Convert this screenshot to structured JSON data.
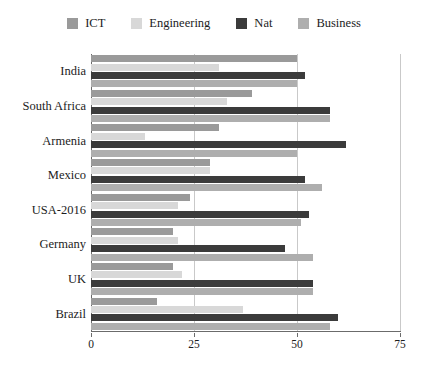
{
  "chart_data": {
    "type": "bar",
    "orientation": "horizontal",
    "title": "",
    "xlabel": "",
    "ylabel": "",
    "xlim": [
      0,
      75
    ],
    "xticks": [
      0,
      25,
      50,
      75
    ],
    "grid": true,
    "legend_position": "top",
    "categories": [
      "India",
      "South Africa",
      "Armenia",
      "Mexico",
      "USA-2016",
      "Germany",
      "UK",
      "Brazil"
    ],
    "series": [
      {
        "name": "ICT",
        "color": "#9a9a9a",
        "values": [
          50,
          39,
          31,
          29,
          24,
          20,
          20,
          16
        ]
      },
      {
        "name": "Engineering",
        "color": "#d8d8d8",
        "values": [
          31,
          33,
          13,
          29,
          21,
          21,
          22,
          37
        ]
      },
      {
        "name": "Nat",
        "color": "#3b3b3b",
        "values": [
          52,
          58,
          62,
          52,
          53,
          47,
          54,
          60
        ]
      },
      {
        "name": "Business",
        "color": "#aeaeae",
        "values": [
          50,
          58,
          50,
          56,
          51,
          54,
          54,
          58
        ]
      }
    ]
  },
  "legend": {
    "items": [
      {
        "label": "ICT",
        "color": "#9a9a9a"
      },
      {
        "label": "Engineering",
        "color": "#d8d8d8"
      },
      {
        "label": "Nat",
        "color": "#3b3b3b"
      },
      {
        "label": "Business",
        "color": "#aeaeae"
      }
    ]
  },
  "axes": {
    "x_tick_labels": [
      "0",
      "25",
      "50",
      "75"
    ],
    "y_tick_labels": [
      "India",
      "South Africa",
      "Armenia",
      "Mexico",
      "USA-2016",
      "Germany",
      "UK",
      "Brazil"
    ]
  },
  "colors": {
    "grid": "#c9c9c9",
    "axis": "#6b6b6b",
    "background": "#ffffff",
    "text": "#1c1c1c"
  }
}
